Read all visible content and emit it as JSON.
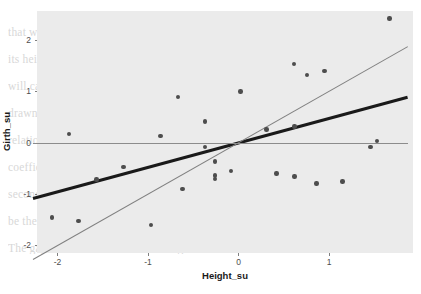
{
  "figure": {
    "panel_background": "#ebebeb",
    "grid_color": "#ffffff",
    "point_color": "#4d4d4d",
    "page_background": "#ffffff"
  },
  "watermark": {
    "lines": [
      "that whatever else you might say about a tree, its girth and",
      "its height are not independent of one another — taller trees",
      "will carry larger girths, and vice versa. The regression line",
      "drawn through the standardised scores summarises that",
      "relationship, and its slope is exactly the correlation",
      "coefficient r between the two standardised variables. The",
      "second, steeper line is the reference line y = x, which would",
      "be the regression line only if the correlation were perfect.",
      "The gap between the two lines is regression to the mean."
    ]
  },
  "chart_data": {
    "type": "scatter",
    "title": "",
    "xlabel": "Height_su",
    "ylabel": "Girth_su",
    "xlim": [
      -2.27,
      1.87
    ],
    "ylim": [
      -2.33,
      2.63
    ],
    "xticks": [
      -2,
      -1,
      0,
      1
    ],
    "xtick_labels": [
      "-2",
      "-1",
      "0",
      "1"
    ],
    "yticks": [
      -2,
      -1,
      0,
      1,
      2
    ],
    "ytick_labels": [
      "-2",
      "-1",
      "0",
      "1",
      "2"
    ],
    "grid": true,
    "grid_minor": true,
    "xminor": [
      -1.5,
      -0.5,
      0.5,
      1.5
    ],
    "yminor": [
      -1.5,
      -0.5,
      0.5,
      1.5,
      2.5
    ],
    "legend": "none",
    "points": [
      {
        "x": -2.06,
        "y": -1.45
      },
      {
        "x": -1.87,
        "y": 0.18
      },
      {
        "x": -1.77,
        "y": -1.52
      },
      {
        "x": -1.57,
        "y": -0.71
      },
      {
        "x": -1.27,
        "y": -0.47
      },
      {
        "x": -0.97,
        "y": -1.59
      },
      {
        "x": -0.86,
        "y": 0.14
      },
      {
        "x": -0.67,
        "y": 0.9
      },
      {
        "x": -0.62,
        "y": -0.89
      },
      {
        "x": -0.37,
        "y": 0.42
      },
      {
        "x": -0.37,
        "y": -0.08
      },
      {
        "x": -0.26,
        "y": -0.36
      },
      {
        "x": -0.26,
        "y": -0.63
      },
      {
        "x": -0.26,
        "y": -0.7
      },
      {
        "x": -0.08,
        "y": -0.55
      },
      {
        "x": 0.02,
        "y": 1.0
      },
      {
        "x": 0.31,
        "y": 0.26
      },
      {
        "x": 0.42,
        "y": -0.59
      },
      {
        "x": 0.61,
        "y": 1.54
      },
      {
        "x": 0.62,
        "y": 0.32
      },
      {
        "x": 0.62,
        "y": -0.65
      },
      {
        "x": 0.76,
        "y": 1.32
      },
      {
        "x": 0.86,
        "y": -0.79
      },
      {
        "x": 0.95,
        "y": 1.4
      },
      {
        "x": 1.15,
        "y": -0.75
      },
      {
        "x": 1.46,
        "y": -0.08
      },
      {
        "x": 1.53,
        "y": 0.04
      },
      {
        "x": 1.67,
        "y": 2.42
      }
    ],
    "series": [
      {
        "name": "regression-line",
        "kind": "line",
        "style": "thick-black",
        "color": "#1a1a1a",
        "width_px": 3.1,
        "slope": 0.474,
        "intercept": 0.0,
        "x_start": -2.27,
        "x_end": 1.87,
        "y_start": -1.08,
        "y_end": 0.89
      },
      {
        "name": "identity-line",
        "kind": "line",
        "style": "thin-grey",
        "color": "#808080",
        "width_px": 1.0,
        "slope": 1.0,
        "intercept": 0.0,
        "x_start": -2.27,
        "x_end": 1.87,
        "y_start": -2.27,
        "y_end": 1.87
      },
      {
        "name": "zero-reference-line",
        "kind": "line",
        "style": "thin-grey-horizontal",
        "color": "#8c8c8c",
        "width_px": 0.9,
        "slope": 0.0,
        "intercept": 0.0,
        "x_start": -2.27,
        "x_end": 1.87,
        "y_start": 0.0,
        "y_end": 0.0
      }
    ]
  },
  "geometry": {
    "panel_left": 37,
    "panel_top": 11,
    "panel_right": 413,
    "panel_bottom": 253,
    "x_zero_px": 238.5,
    "y_zero_px": 143.0,
    "px_per_x_unit": 90.5,
    "px_per_y_unit": 51.4
  }
}
